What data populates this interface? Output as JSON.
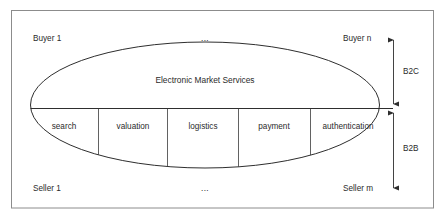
{
  "diagram": {
    "title": "Electronic Market Services",
    "frame": {
      "label": "diagram-frame"
    },
    "corners": {
      "top_left": "Buyer 1",
      "top_center": "...",
      "top_right": "Buyer n",
      "bottom_left": "Seller 1",
      "bottom_center": "...",
      "bottom_right": "Seller m"
    },
    "services": [
      {
        "label": "search"
      },
      {
        "label": "valuation"
      },
      {
        "label": "logistics"
      },
      {
        "label": "payment"
      },
      {
        "label": "authentication"
      }
    ],
    "axis": {
      "upper_label": "B2C",
      "lower_label": "B2B"
    },
    "colors": {
      "frame": "#8c8c8c",
      "ellipse": "#2e2e2e",
      "divider": "#3a3a3a",
      "text": "#2b2b2b",
      "background": "#ffffff"
    }
  }
}
